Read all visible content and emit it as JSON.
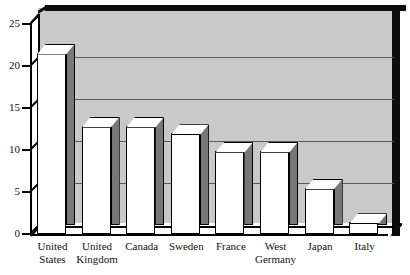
{
  "chart_data": {
    "type": "bar",
    "title": "",
    "subtitle": "",
    "xlabel": "",
    "ylabel": "",
    "ylim": [
      0,
      25
    ],
    "yticks": [
      0,
      5,
      10,
      15,
      20,
      25
    ],
    "grid": true,
    "gridlines_at": [
      5,
      10,
      15,
      20
    ],
    "legend": "none",
    "style": "3d-bar",
    "categories": [
      "United States",
      "United Kingdom",
      "Canada",
      "Sweden",
      "France",
      "West Germany",
      "Japan",
      "Italy"
    ],
    "category_lines": [
      [
        "United",
        "States"
      ],
      [
        "United",
        "Kingdom"
      ],
      [
        "Canada",
        ""
      ],
      [
        "Sweden",
        ""
      ],
      [
        "France",
        ""
      ],
      [
        "West",
        "Germany"
      ],
      [
        "Japan",
        ""
      ],
      [
        "Italy",
        ""
      ]
    ],
    "values": [
      21.6,
      12.9,
      12.9,
      12.0,
      9.9,
      9.9,
      5.5,
      1.4
    ]
  },
  "axis": {
    "y_tick_labels": [
      "25",
      "20",
      "15",
      "10",
      "5",
      "0"
    ]
  },
  "colors": {
    "plot_background": "#c9c9c9",
    "wall_edge": "#0d0d0d",
    "gridline": "#5a5a5a",
    "bar_front": "#ffffff",
    "bar_side": "#777777",
    "bar_outline": "#000000",
    "text": "#111111",
    "page_background": "#ffffff"
  }
}
